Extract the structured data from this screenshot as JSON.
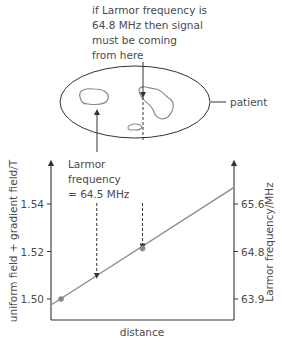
{
  "annotation_top": {
    "lines": [
      "if Larmor frequency is",
      "64.8 MHz then signal",
      "must be coming",
      "from here"
    ]
  },
  "patient_label": "patient",
  "annotation_left": {
    "lines": [
      "Larmor",
      "frequency",
      "= 64.5 MHz"
    ]
  },
  "colors": {
    "axis": "#333333",
    "line": "#8a8a8a",
    "marker": "#8a8a8a",
    "text": "#4a4a4a"
  },
  "chart_data": {
    "type": "line",
    "title": "",
    "xlabel": "distance",
    "ylabel": "uniform field + gradient field/T",
    "ylabel_right": "Larmor frequency/MHz",
    "yticks_left": [
      "1.50",
      "1.52",
      "1.54"
    ],
    "yticks_left_values": [
      1.5,
      1.52,
      1.54
    ],
    "yticks_right": [
      "63.9",
      "64.8",
      "65.6"
    ],
    "ylim": [
      1.4935,
      1.565
    ],
    "grid": false,
    "series": [
      {
        "name": "field",
        "x": [
          0.0,
          1.0
        ],
        "y": [
          1.4975,
          1.547
        ]
      }
    ],
    "markers": [
      {
        "x": 0.055,
        "y": 1.5
      },
      {
        "x": 0.5,
        "y": 1.5213
      }
    ],
    "dashed_arrows": [
      {
        "x": 0.25,
        "target_y": 1.509
      },
      {
        "x": 0.5,
        "target_y": 1.5213
      }
    ]
  }
}
